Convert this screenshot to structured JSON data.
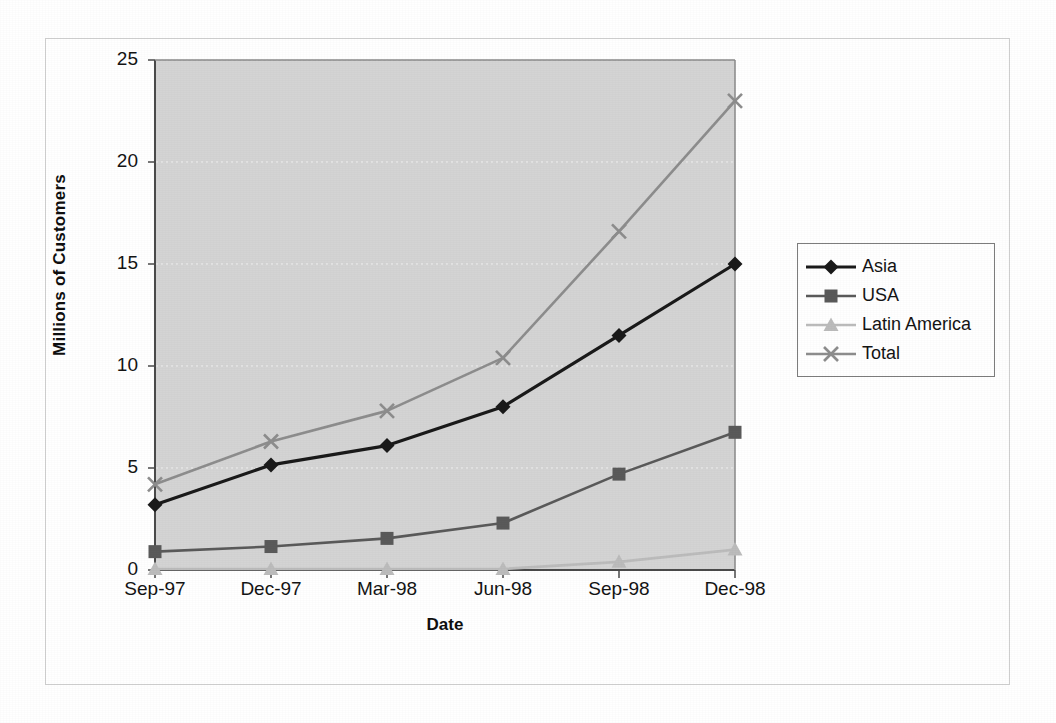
{
  "chart_data": {
    "type": "line",
    "title": "",
    "xlabel": "Date",
    "ylabel": "Millions of Customers",
    "categories": [
      "Sep-97",
      "Dec-97",
      "Mar-98",
      "Jun-98",
      "Sep-98",
      "Dec-98"
    ],
    "ylim": [
      0,
      25
    ],
    "yticks": [
      0,
      5,
      10,
      15,
      20,
      25
    ],
    "grid": "horizontal-dotted",
    "legend_position": "right",
    "plot_background": "#d4d4d4",
    "series": [
      {
        "name": "Asia",
        "marker": "diamond",
        "color": "#1a1a1a",
        "values": [
          3.2,
          5.15,
          6.1,
          8.0,
          11.5,
          15.0
        ]
      },
      {
        "name": "USA",
        "marker": "square",
        "color": "#5a5a5a",
        "values": [
          0.9,
          1.15,
          1.55,
          2.3,
          4.7,
          6.75
        ]
      },
      {
        "name": "Latin America",
        "marker": "triangle",
        "color": "#bcbcbc",
        "values": [
          0.05,
          0.05,
          0.05,
          0.05,
          0.4,
          1.0
        ]
      },
      {
        "name": "Total",
        "marker": "cross",
        "color": "#8d8d8d",
        "values": [
          4.2,
          6.3,
          7.8,
          10.4,
          16.6,
          23.0
        ]
      }
    ]
  },
  "axes": {
    "y_tick_labels": [
      "25",
      "20",
      "15",
      "10",
      "5",
      "0"
    ],
    "x_tick_labels": [
      "Sep-97",
      "Dec-97",
      "Mar-98",
      "Jun-98",
      "Sep-98",
      "Dec-98"
    ],
    "y_title": "Millions of Customers",
    "x_title": "Date"
  },
  "legend": {
    "items": [
      {
        "label": "Asia",
        "marker": "diamond-marker-icon",
        "color": "#1a1a1a"
      },
      {
        "label": "USA",
        "marker": "square-marker-icon",
        "color": "#5a5a5a"
      },
      {
        "label": "Latin America",
        "marker": "triangle-marker-icon",
        "color": "#bcbcbc"
      },
      {
        "label": "Total",
        "marker": "cross-marker-icon",
        "color": "#8d8d8d"
      }
    ]
  }
}
